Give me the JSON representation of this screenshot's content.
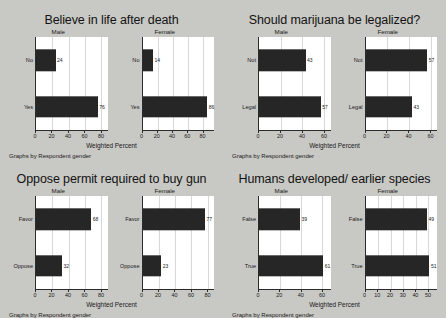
{
  "figures": [
    {
      "title": "Believe in life after death",
      "note": "Graphs by Respondent gender",
      "xlabel": "Weighted Percent",
      "chart_data": {
        "type": "bar",
        "orientation": "horizontal",
        "title": "Believe in life after death",
        "xlabel": "Weighted Percent",
        "ylabel": "",
        "panel_by": "Respondent gender",
        "categories": [
          "Yes",
          "No"
        ],
        "panels": [
          {
            "name": "Male",
            "ticks": [
              0,
              20,
              40,
              60,
              80
            ],
            "xlim": [
              0,
              88
            ],
            "values": [
              76,
              24
            ],
            "labels": [
              "76",
              "24"
            ]
          },
          {
            "name": "Female",
            "ticks": [
              0,
              20,
              40,
              60,
              80
            ],
            "xlim": [
              0,
              95
            ],
            "values": [
              86,
              14
            ],
            "labels": [
              "86",
              "14"
            ]
          }
        ]
      }
    },
    {
      "title": "Should marijuana be legalized?",
      "note": "Graphs by Respondent gender",
      "xlabel": "Weighted Percent",
      "chart_data": {
        "type": "bar",
        "orientation": "horizontal",
        "title": "Should marijuana be legalized?",
        "xlabel": "Weighted Percent",
        "ylabel": "",
        "panel_by": "Respondent gender",
        "categories": [
          "Legal",
          "Not"
        ],
        "panels": [
          {
            "name": "Male",
            "ticks": [
              0,
              20,
              40,
              60
            ],
            "xlim": [
              0,
              66
            ],
            "values": [
              57,
              43
            ],
            "labels": [
              "57",
              "43"
            ]
          },
          {
            "name": "Female",
            "ticks": [
              0,
              20,
              40,
              60
            ],
            "xlim": [
              0,
              66
            ],
            "values": [
              43,
              57
            ],
            "labels": [
              "43",
              "57"
            ]
          }
        ]
      }
    },
    {
      "title": "Oppose permit required to buy gun",
      "note": "Graphs by Respondent gender",
      "xlabel": "Weighted Percent",
      "chart_data": {
        "type": "bar",
        "orientation": "horizontal",
        "title": "Oppose permit required to buy gun",
        "xlabel": "Weighted Percent",
        "ylabel": "",
        "panel_by": "Respondent gender",
        "categories": [
          "Oppose",
          "Favor"
        ],
        "panels": [
          {
            "name": "Male",
            "ticks": [
              0,
              20,
              40,
              60,
              80
            ],
            "xlim": [
              0,
              88
            ],
            "values": [
              32,
              68
            ],
            "labels": [
              "32",
              "68"
            ]
          },
          {
            "name": "Female",
            "ticks": [
              0,
              20,
              40,
              60,
              80
            ],
            "xlim": [
              0,
              88
            ],
            "values": [
              23,
              77
            ],
            "labels": [
              "23",
              "77"
            ]
          }
        ]
      }
    },
    {
      "title": "Humans developed/ earlier species",
      "note": "Graphs by Respondent gender",
      "xlabel": "Weighted Percent",
      "chart_data": {
        "type": "bar",
        "orientation": "horizontal",
        "title": "Humans developed/ earlier species",
        "xlabel": "Weighted Percent",
        "ylabel": "",
        "panel_by": "Respondent gender",
        "categories": [
          "True",
          "False"
        ],
        "panels": [
          {
            "name": "Male",
            "ticks": [
              0,
              20,
              40,
              60
            ],
            "xlim": [
              0,
              68
            ],
            "values": [
              61,
              39
            ],
            "labels": [
              "61",
              "39"
            ]
          },
          {
            "name": "Female",
            "ticks": [
              0,
              10,
              20,
              30,
              40,
              50
            ],
            "xlim": [
              0,
              57
            ],
            "values": [
              51,
              49
            ],
            "labels": [
              "51",
              "49"
            ]
          }
        ]
      }
    }
  ],
  "colors": {
    "background": "#c8c8c4",
    "plot_background": "#ffffff",
    "bar": "#262626",
    "axis": "#2b2b2b",
    "gridline": "#d8d8d8",
    "text": "#1a1a1a"
  }
}
